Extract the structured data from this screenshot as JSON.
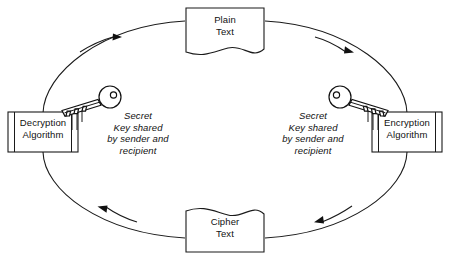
{
  "diagram": {
    "nodes": {
      "plain_text": {
        "label": "Plain\nText",
        "shape": "document",
        "name": "plain-text-node"
      },
      "cipher_text": {
        "label": "Cipher\nText",
        "shape": "document-flipped",
        "name": "cipher-text-node"
      },
      "decryption": {
        "label": "Decryption\nAlgorithm",
        "shape": "process-box",
        "name": "decryption-algorithm-node"
      },
      "encryption": {
        "label": "Encryption\nAlgorithm",
        "shape": "process-box",
        "name": "encryption-algorithm-node"
      }
    },
    "annotations": {
      "secret_key_left": "Secret\nKey shared\nby sender and\nrecipient",
      "secret_key_right": "Secret\nKey shared\nby sender and\nrecipient"
    },
    "icons": {
      "key_left": "key-icon",
      "key_right": "key-icon"
    },
    "flow": [
      {
        "from": "decryption",
        "to": "plain_text",
        "direction": "up-right",
        "name": "arrow-decryption-to-plain-text"
      },
      {
        "from": "plain_text",
        "to": "encryption",
        "direction": "down-right",
        "name": "arrow-plain-text-to-encryption"
      },
      {
        "from": "encryption",
        "to": "cipher_text",
        "direction": "down-left",
        "name": "arrow-encryption-to-cipher-text"
      },
      {
        "from": "cipher_text",
        "to": "decryption",
        "direction": "up-left",
        "name": "arrow-cipher-text-to-decryption"
      }
    ],
    "colors": {
      "stroke": "#1a1a1a",
      "fill": "#ffffff",
      "text": "#111111",
      "arrow": "#111111"
    }
  }
}
